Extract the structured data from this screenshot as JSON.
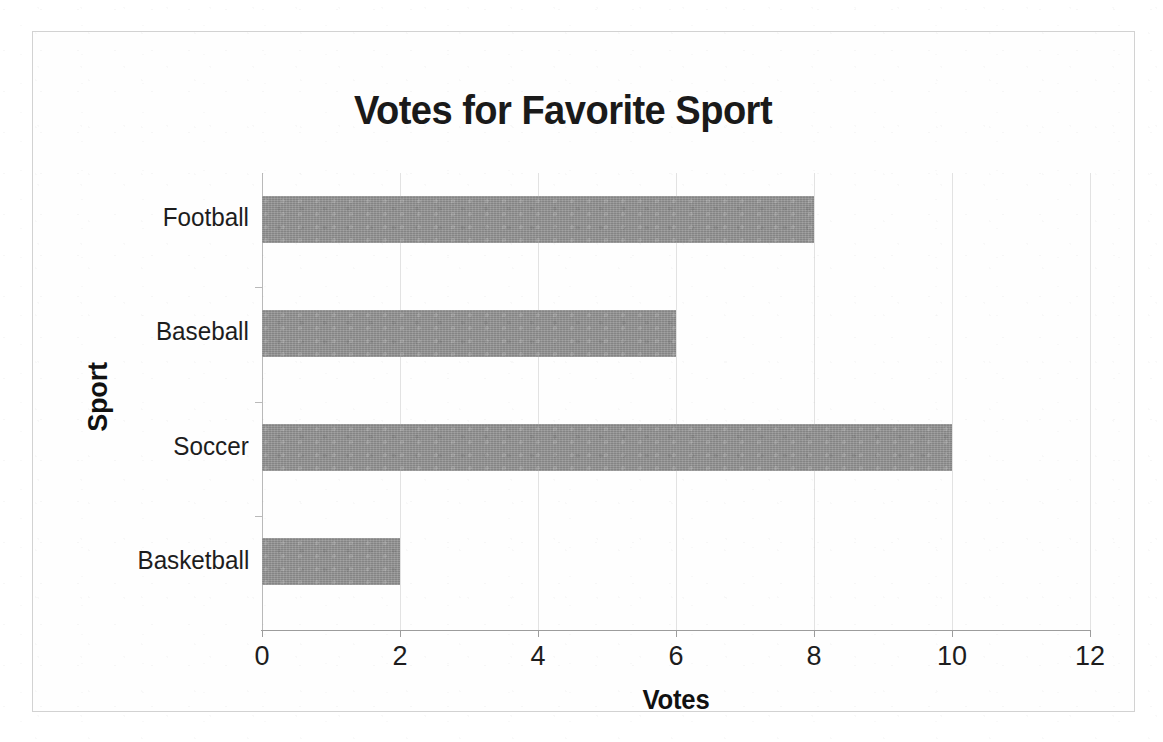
{
  "chart_data": {
    "type": "bar",
    "orientation": "horizontal",
    "title": "Votes for Favorite Sport",
    "xlabel": "Votes",
    "ylabel": "Sport",
    "categories": [
      "Football",
      "Baseball",
      "Soccer",
      "Basketball"
    ],
    "values": [
      8,
      6,
      10,
      2
    ],
    "series": [
      {
        "name": "Votes",
        "values": [
          8,
          6,
          10,
          2
        ]
      }
    ],
    "xlim": [
      0,
      12
    ],
    "xticks": [
      0,
      2,
      4,
      6,
      8,
      10,
      12
    ],
    "xtick_labels": [
      "0",
      "2",
      "4",
      "6",
      "8",
      "10",
      "12"
    ],
    "grid": "vertical",
    "legend": "none",
    "bar_color": "#919191",
    "gridline_color": "#e2e2e2",
    "axis_color": "#9c9c9c",
    "text_color": "#1d1d1d",
    "background": "#ffffff"
  }
}
